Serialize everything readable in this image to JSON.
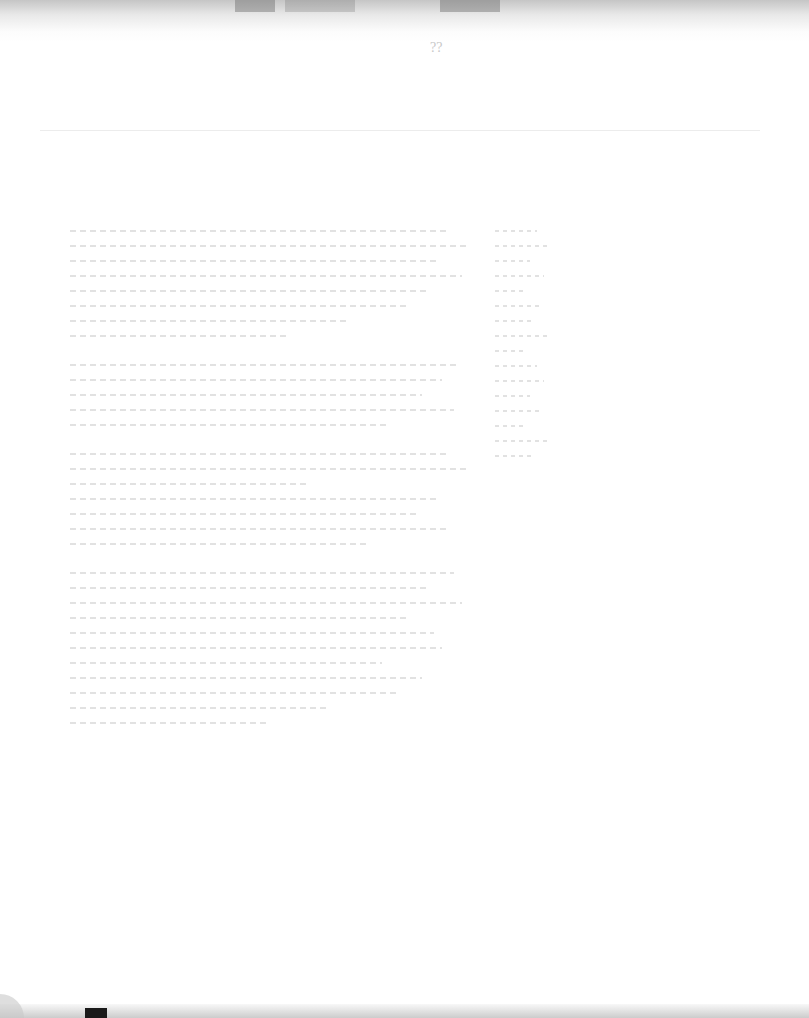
{
  "document": {
    "type": "scanned-page",
    "legibility": "illegible",
    "header_mark": "??",
    "body_text_lines": [],
    "right_column_entries": []
  }
}
